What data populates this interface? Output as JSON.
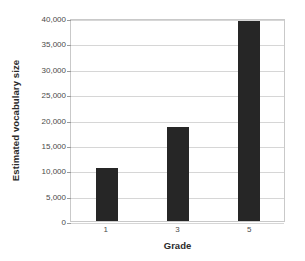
{
  "chart_data": {
    "type": "bar",
    "title": "",
    "categories": [
      "1",
      "3",
      "5"
    ],
    "values": [
      10500,
      18500,
      39500
    ],
    "xlabel": "Grade",
    "ylabel": "Estimated vocabulary size",
    "ylim": [
      0,
      40000
    ],
    "ytick_step": 5000,
    "ytick_labels": [
      "0",
      "5,000",
      "10,000",
      "15,000",
      "20,000",
      "25,000",
      "30,000",
      "35,000",
      "40,000"
    ],
    "ytick_values": [
      0,
      5000,
      10000,
      15000,
      20000,
      25000,
      30000,
      35000,
      40000
    ],
    "grid": true,
    "legend": false,
    "legend_position": "none",
    "series": [
      {
        "name": "Estimated vocabulary size",
        "values": [
          10500,
          18500,
          39500
        ]
      }
    ],
    "colors": {
      "bar": "#262626",
      "gridline": "#d6d6d6",
      "axis_frame": "#c9c9c9",
      "background": "#ffffff",
      "tick_text": "#4a4a4a",
      "title_text": "#2b2b2b"
    }
  }
}
